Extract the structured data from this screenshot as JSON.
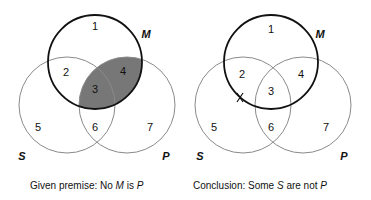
{
  "colors": {
    "m_circle_stroke": "#111111",
    "sp_circle_stroke": "#8a8a8a",
    "shade_fill": "#777777",
    "text": "#111111",
    "background": "#ffffff"
  },
  "diagrams": [
    {
      "id": "premise",
      "sets": {
        "M": "M",
        "S": "S",
        "P": "P"
      },
      "regions": [
        "1",
        "2",
        "3",
        "4",
        "5",
        "6",
        "7"
      ],
      "shaded_regions": [
        "3",
        "4"
      ],
      "x_mark_on": "",
      "caption": {
        "prefix": "Given premise: No ",
        "term1": "M",
        "middle": " is ",
        "term2": "P",
        "suffix": ""
      }
    },
    {
      "id": "conclusion",
      "sets": {
        "M": "M",
        "S": "S",
        "P": "P"
      },
      "regions": [
        "1",
        "2",
        "3",
        "4",
        "5",
        "6",
        "7"
      ],
      "shaded_regions": [],
      "x_mark": "X",
      "x_mark_on": "border of M between regions 2 and 5",
      "caption": {
        "prefix": "Conclusion: Some ",
        "term1": "S",
        "middle": " are not ",
        "term2": "P",
        "suffix": ""
      }
    }
  ]
}
